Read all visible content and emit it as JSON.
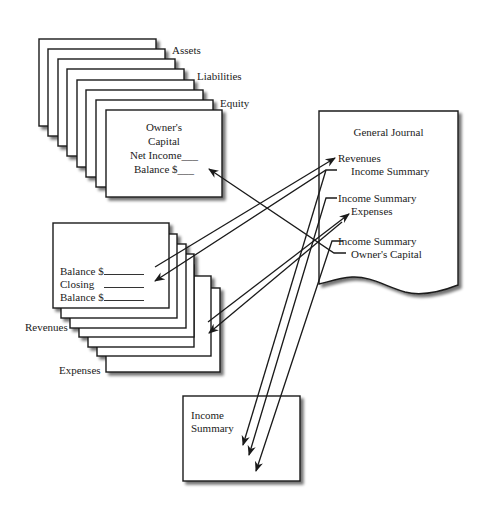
{
  "ledger_accounts": {
    "stack_labels": [
      "Assets",
      "Liabilities",
      "Equity"
    ],
    "front_card": {
      "title_line1": "Owner's",
      "title_line2": "Capital",
      "row1": "Net Income___",
      "row2": "Balance $___"
    }
  },
  "temporary_accounts": {
    "stack_labels": [
      "Revenues",
      "Expenses"
    ],
    "front_card": {
      "row1_label": "Balance $",
      "row2_label": "Closing",
      "row3_label": "Balance $"
    }
  },
  "general_journal": {
    "title": "General Journal",
    "entries": [
      {
        "debit": "Revenues",
        "credit": "Income Summary"
      },
      {
        "debit": "Income Summary",
        "credit": "Expenses"
      },
      {
        "debit": "Income Summary",
        "credit": "Owner's Capital"
      }
    ]
  },
  "income_summary_box": {
    "title_line1": "Income",
    "title_line2": "Summary"
  },
  "colors": {
    "stroke": "#1a1a1a",
    "shadow": "#9a9a9a",
    "background": "#ffffff"
  }
}
